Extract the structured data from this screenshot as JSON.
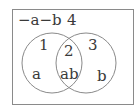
{
  "diagram": {
    "type": "venn",
    "universe": {
      "label": "−a−b",
      "region_number": "4"
    },
    "sets": [
      {
        "name": "left",
        "region_number": "1",
        "label": "a"
      },
      {
        "name": "right",
        "region_number": "3",
        "label": "b"
      }
    ],
    "intersection": {
      "region_number": "2",
      "label": "ab"
    },
    "colors": {
      "stroke": "#8a8a8a",
      "text": "#3a3a3a",
      "background": "#ffffff"
    }
  }
}
